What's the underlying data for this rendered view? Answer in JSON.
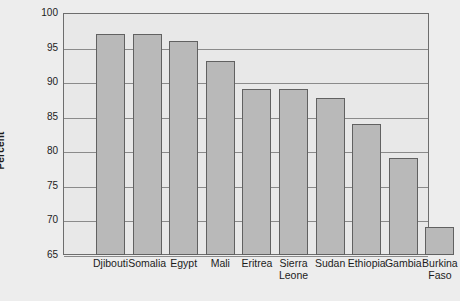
{
  "chart_data": {
    "type": "bar",
    "title": "",
    "xlabel": "",
    "ylabel": "Percent",
    "ylim": [
      65,
      100
    ],
    "ytick_step": 5,
    "yticks": [
      100,
      95,
      90,
      85,
      80,
      75,
      70,
      65
    ],
    "grid": true,
    "legend": "none",
    "categories": [
      "Djibouti",
      "Somalia",
      "Egypt",
      "Mali",
      "Eritrea",
      "Sierra Leone",
      "Sudan",
      "Ethiopia",
      "Gambia",
      "Burkina Faso"
    ],
    "category_lines": [
      [
        "Djibouti",
        ""
      ],
      [
        "Somalia",
        ""
      ],
      [
        "Egypt",
        ""
      ],
      [
        "Mali",
        ""
      ],
      [
        "Eritrea",
        ""
      ],
      [
        "Sierra",
        "Leone"
      ],
      [
        "Sudan",
        ""
      ],
      [
        "Ethiopia",
        ""
      ],
      [
        "Gambia",
        ""
      ],
      [
        "Burkina",
        "Faso"
      ]
    ],
    "values": [
      97,
      97,
      96,
      93,
      89,
      89,
      87.7,
      84,
      79,
      69
    ],
    "bar_color": "#b9b9b9",
    "bar_border_color": "#616161",
    "plot_background": "#e8e8e8",
    "figure_background": "#ededed",
    "gridline_color": "#8a8a8a",
    "axis_color": "#6d6d6d",
    "text_color": "#1c1c1c"
  }
}
